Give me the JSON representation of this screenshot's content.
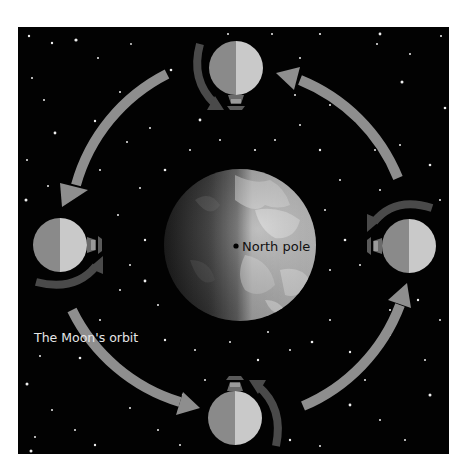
{
  "diagram": {
    "labels": {
      "north_pole": "North pole",
      "moon_orbit": "The Moon's orbit"
    },
    "colors": {
      "background": "#ffffff",
      "space": "#020202",
      "star": "#f2f2f2",
      "orbit_arrow": "#8e8e8e",
      "orbit_arrow_tail": "#6e6e6e",
      "rotation_arrow": "#4a4a4a",
      "moon_dark_half": "#8a8a8a",
      "moon_lit_half": "#c9c9c9",
      "earth_lit": "#bdbdbd",
      "earth_dark": "#1a1a1a",
      "north_pole_dot": "#000000",
      "label_dark": "#111111",
      "label_light": "#e6e6e6"
    },
    "earth": {
      "cx": 240,
      "cy": 245,
      "r": 76
    },
    "moons": [
      {
        "position": "top",
        "cx": 236,
        "cy": 68,
        "r": 27,
        "lander_side": "bottom"
      },
      {
        "position": "left",
        "cx": 60,
        "cy": 245,
        "r": 27,
        "lander_side": "right"
      },
      {
        "position": "right",
        "cx": 409,
        "cy": 246,
        "r": 27,
        "lander_side": "left"
      },
      {
        "position": "bottom",
        "cx": 235,
        "cy": 418,
        "r": 27,
        "lander_side": "top"
      }
    ],
    "orbit_direction": "counter-clockwise",
    "orbit_arrows": [
      {
        "from": "top",
        "to": "left"
      },
      {
        "from": "left",
        "to": "bottom"
      },
      {
        "from": "bottom",
        "to": "right"
      },
      {
        "from": "right",
        "to": "top"
      }
    ]
  }
}
